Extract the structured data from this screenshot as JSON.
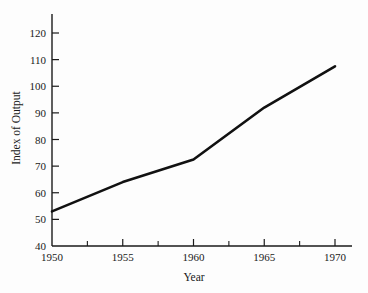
{
  "chart_data": {
    "type": "line",
    "title": "",
    "xlabel": "Year",
    "ylabel": "Index of Output",
    "x": [
      1950,
      1955,
      1960,
      1965,
      1970
    ],
    "values": [
      53,
      64,
      72.5,
      92,
      107.5
    ],
    "series": [
      {
        "name": "Index of Output",
        "x": [
          1950,
          1955,
          1960,
          1965,
          1970
        ],
        "values": [
          53,
          64,
          72.5,
          92,
          107.5
        ]
      }
    ],
    "xlim": [
      1950,
      1970
    ],
    "ylim": [
      40,
      120
    ],
    "x_major_ticks": [
      1950,
      1955,
      1960,
      1965,
      1970
    ],
    "x_minor_ticks": [
      1952.5,
      1957.5,
      1962.5,
      1967.5
    ],
    "y_ticks": [
      40,
      50,
      60,
      70,
      80,
      90,
      100,
      110,
      120
    ],
    "x_tick_labels": [
      "1950",
      "1955",
      "1960",
      "1965",
      "1970"
    ],
    "y_tick_labels": [
      "40",
      "50",
      "60",
      "70",
      "80",
      "90",
      "100",
      "110",
      "120"
    ],
    "grid": false,
    "legend": false,
    "legend_position": "none",
    "line_color": "#111111",
    "axis_color": "#1a1a1a",
    "background_color": "#fdfdfd"
  }
}
